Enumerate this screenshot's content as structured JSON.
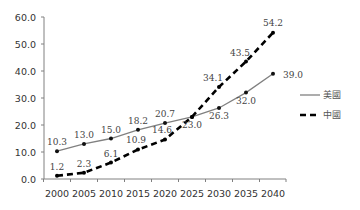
{
  "chart_data": {
    "type": "line",
    "title": "",
    "xlabel": "",
    "ylabel": "",
    "x": [
      2000,
      2005,
      2010,
      2015,
      2020,
      2025,
      2030,
      2035,
      2040
    ],
    "categories": [
      "2000",
      "2005",
      "2010",
      "2015",
      "2020",
      "2025",
      "2030",
      "2035",
      "2040"
    ],
    "series": [
      {
        "name": "美國",
        "style": "solid",
        "color": "#808080",
        "values": [
          10.3,
          13.0,
          15.0,
          18.2,
          20.7,
          23.0,
          26.3,
          32.0,
          39.0
        ],
        "labels": [
          "10.3",
          "13.0",
          "15.0",
          "18.2",
          "20.7",
          "23.0",
          "26.3",
          "32.0",
          "39.0"
        ]
      },
      {
        "name": "中國",
        "style": "dashed",
        "color": "#000000",
        "values": [
          1.2,
          2.3,
          6.1,
          10.9,
          14.6,
          23.0,
          34.1,
          43.5,
          54.2
        ],
        "labels": [
          "1.2",
          "2.3",
          "6.1",
          "10.9",
          "14.6",
          "",
          "34.1",
          "43.5",
          "54.2"
        ]
      }
    ],
    "ylim": [
      0,
      60
    ],
    "yticks": [
      "0.0",
      "10.0",
      "20.0",
      "30.0",
      "40.0",
      "50.0",
      "60.0"
    ],
    "grid": false,
    "legend_position": "right"
  }
}
